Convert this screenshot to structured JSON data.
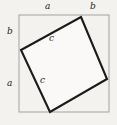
{
  "figure": {
    "kind": "geometry-diagram",
    "background_color": "#f4f2ef",
    "outer_square": {
      "name": "outer-square",
      "stroke_color": "#9a9a9a",
      "stroke_width": 0.9,
      "fill": "none",
      "corners": [
        [
          19,
          15
        ],
        [
          109,
          15
        ],
        [
          109,
          112
        ],
        [
          19,
          112
        ]
      ]
    },
    "inner_square": {
      "name": "inner-tilted-square",
      "stroke_color": "#1b1b1b",
      "stroke_width": 2.1,
      "fill": "#faf9f7",
      "vertices": [
        [
          81,
          17
        ],
        [
          107,
          79
        ],
        [
          50,
          112
        ],
        [
          21,
          50
        ]
      ]
    },
    "labels": [
      {
        "id": "a-top",
        "text": "a",
        "side": "top",
        "x": 48,
        "y": 6
      },
      {
        "id": "b-top",
        "text": "b",
        "side": "top",
        "x": 93,
        "y": 6
      },
      {
        "id": "b-left",
        "text": "b",
        "side": "left",
        "x": 10,
        "y": 31
      },
      {
        "id": "a-left",
        "text": "a",
        "side": "left",
        "x": 10,
        "y": 83
      },
      {
        "id": "c-upper",
        "text": "c",
        "side": "inner",
        "x": 52,
        "y": 38
      },
      {
        "id": "c-lower",
        "text": "c",
        "side": "inner",
        "x": 43,
        "y": 80
      }
    ]
  }
}
